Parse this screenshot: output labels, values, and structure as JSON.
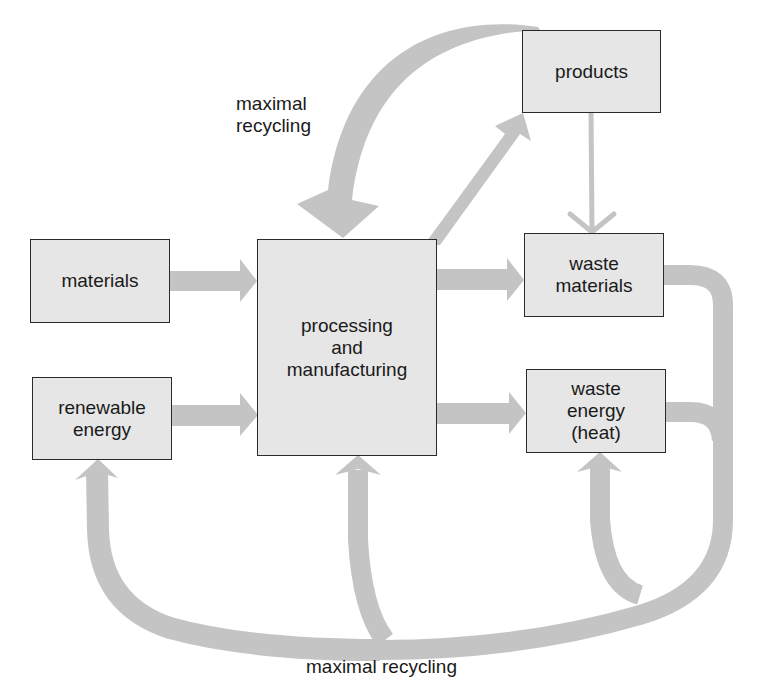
{
  "diagram": {
    "type": "flow",
    "colors": {
      "box_fill": "#e6e6e6",
      "box_border": "#2a2a2a",
      "arrow": "#c4c4c4",
      "text": "#1a1a1a"
    },
    "nodes": {
      "materials": "materials",
      "renewable_energy": "renewable\nenergy",
      "processing": "processing\nand\nmanufacturing",
      "products": "products",
      "waste_materials": "waste\nmaterials",
      "waste_energy": "waste\nenergy\n(heat)"
    },
    "labels": {
      "top_recycling": "maximal\nrecycling",
      "bottom_recycling": "maximal recycling"
    },
    "edges": [
      {
        "from": "materials",
        "to": "processing and manufacturing"
      },
      {
        "from": "renewable energy",
        "to": "processing and manufacturing"
      },
      {
        "from": "processing and manufacturing",
        "to": "products"
      },
      {
        "from": "processing and manufacturing",
        "to": "waste materials"
      },
      {
        "from": "processing and manufacturing",
        "to": "waste energy (heat)"
      },
      {
        "from": "products",
        "to": "waste materials"
      },
      {
        "from": "products",
        "to": "processing and manufacturing",
        "label": "maximal recycling"
      },
      {
        "from": "waste materials",
        "to": "renewable energy",
        "label": "maximal recycling"
      },
      {
        "from": "waste materials",
        "to": "processing and manufacturing",
        "label": "maximal recycling"
      },
      {
        "from": "waste energy (heat)",
        "to": "waste energy (heat)",
        "label": "maximal recycling"
      }
    ]
  }
}
